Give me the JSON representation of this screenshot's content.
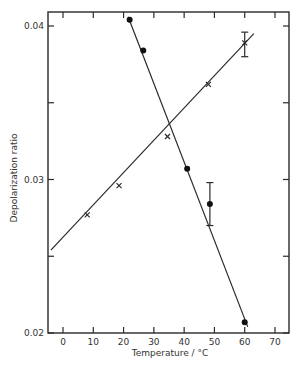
{
  "chart_data": {
    "type": "scatter",
    "title": "",
    "xlabel": "Temperature / °C",
    "ylabel": "Depolarization ratio",
    "xlim": [
      -5,
      75
    ],
    "ylim": [
      0.02,
      0.041
    ],
    "x_ticks": [
      0,
      10,
      20,
      30,
      40,
      50,
      60,
      70
    ],
    "x_tick_labels": [
      "0",
      "10",
      "20",
      "30",
      "40",
      "50",
      "60",
      "70"
    ],
    "y_ticks": [
      0.02,
      0.025,
      0.03,
      0.035,
      0.04
    ],
    "y_tick_labels": [
      "0.02",
      "",
      "0.03",
      "",
      "0.04"
    ],
    "grid": false,
    "legend": null,
    "series": [
      {
        "name": "crosses",
        "marker": "x",
        "points": [
          {
            "x": 8,
            "y": 0.0277
          },
          {
            "x": 18.5,
            "y": 0.0296
          },
          {
            "x": 34.5,
            "y": 0.0328
          },
          {
            "x": 48,
            "y": 0.0362
          },
          {
            "x": 60,
            "y": 0.0389,
            "err_low": 0.038,
            "err_high": 0.0396
          }
        ],
        "fit_line": {
          "x0": -4,
          "y0": 0.0254,
          "x1": 63,
          "y1": 0.0395
        }
      },
      {
        "name": "dots",
        "marker": "filled-circle",
        "points": [
          {
            "x": 22,
            "y": 0.0404
          },
          {
            "x": 26.5,
            "y": 0.0384
          },
          {
            "x": 41,
            "y": 0.0307
          },
          {
            "x": 48.5,
            "y": 0.0284,
            "err_low": 0.027,
            "err_high": 0.0298
          },
          {
            "x": 60,
            "y": 0.0207
          }
        ],
        "fit_line": {
          "x0": 21.5,
          "y0": 0.0406,
          "x1": 61,
          "y1": 0.0204
        }
      }
    ]
  },
  "axes": {
    "xlabel": "Temperature / °C",
    "ylabel": "Depolarization ratio"
  }
}
